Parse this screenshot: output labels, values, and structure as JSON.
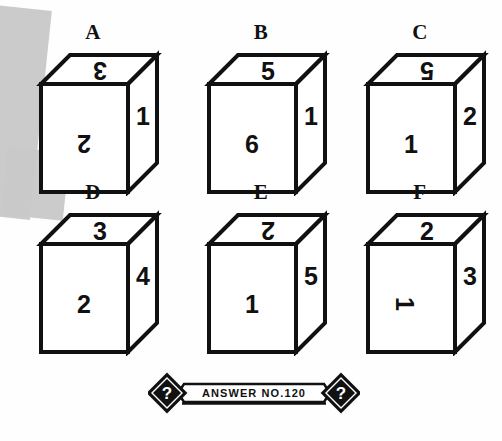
{
  "puzzle": {
    "type": "dice-net-cube-reasoning",
    "cubes": [
      {
        "label": "A",
        "top": {
          "value": "3",
          "rotation": 180
        },
        "front": {
          "value": "2",
          "rotation": 180
        },
        "right": {
          "value": "1",
          "rotation": 0
        }
      },
      {
        "label": "B",
        "top": {
          "value": "5",
          "rotation": 0
        },
        "front": {
          "value": "6",
          "rotation": 0
        },
        "right": {
          "value": "1",
          "rotation": 0
        }
      },
      {
        "label": "C",
        "top": {
          "value": "5",
          "rotation": 180
        },
        "front": {
          "value": "1",
          "rotation": 0
        },
        "right": {
          "value": "2",
          "rotation": 0
        }
      },
      {
        "label": "D",
        "top": {
          "value": "3",
          "rotation": 0
        },
        "front": {
          "value": "2",
          "rotation": 0
        },
        "right": {
          "value": "4",
          "rotation": 0
        }
      },
      {
        "label": "E",
        "top": {
          "value": "2",
          "rotation": 180
        },
        "front": {
          "value": "1",
          "rotation": 0
        },
        "right": {
          "value": "5",
          "rotation": 0
        }
      },
      {
        "label": "F",
        "top": {
          "value": "2",
          "rotation": 0
        },
        "front": {
          "value": "1",
          "rotation": 90
        },
        "right": {
          "value": "3",
          "rotation": 0
        }
      }
    ]
  },
  "banner": {
    "text": "ANSWER NO.120",
    "left_symbol": "?",
    "right_symbol": "?"
  },
  "colors": {
    "ink": "#111111",
    "paper": "#fefefe",
    "artifact_gray": "#c8c8c8"
  }
}
